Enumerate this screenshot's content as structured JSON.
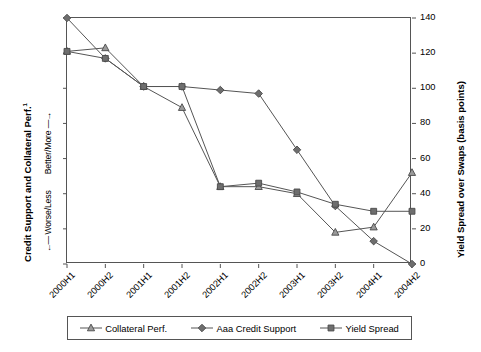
{
  "chart_data": {
    "type": "line",
    "title": "",
    "xlabel": "",
    "ylabel_left": "Credit Support and Collateral Perf.",
    "ylabel_left_superscript": "1",
    "ylabel_left_scale_low": "Worse/Less",
    "ylabel_left_scale_high": "Better/More",
    "ylabel_right": "Yield Spread over Swaps (basis points)",
    "categories": [
      "2000H1",
      "2000H2",
      "2001H1",
      "2001H2",
      "2002H1",
      "2002H2",
      "2003H1",
      "2003H2",
      "2004H1",
      "2004H2"
    ],
    "ylim": [
      0,
      140
    ],
    "yticks": [
      0,
      20,
      40,
      60,
      80,
      100,
      120,
      140
    ],
    "grid": false,
    "legend_position": "bottom",
    "series": [
      {
        "name": "Collateral Perf.",
        "marker": "triangle",
        "color": "#555555",
        "values": [
          121,
          123,
          101,
          89,
          44,
          44,
          40,
          18,
          21,
          52
        ]
      },
      {
        "name": "Aaa Credit Support",
        "marker": "diamond",
        "color": "#555555",
        "values": [
          140,
          117,
          101,
          101,
          99,
          97,
          65,
          33,
          13,
          0
        ]
      },
      {
        "name": "Yield Spread",
        "marker": "square",
        "color": "#555555",
        "values": [
          121,
          117,
          101,
          101,
          44,
          46,
          41,
          34,
          30,
          30
        ]
      }
    ]
  },
  "axis_right_ticks": [
    "0",
    "20",
    "40",
    "60",
    "80",
    "100",
    "120",
    "140"
  ],
  "legend": {
    "items": [
      {
        "label": "Collateral Perf.",
        "marker": "triangle"
      },
      {
        "label": "Aaa Credit Support",
        "marker": "diamond"
      },
      {
        "label": "Yield Spread",
        "marker": "square"
      }
    ]
  }
}
